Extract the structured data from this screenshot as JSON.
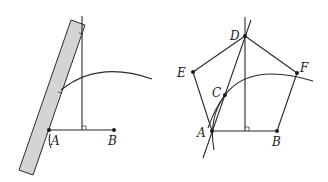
{
  "figure_left": {
    "labels": {
      "A": "A",
      "B": "B"
    },
    "colors": {
      "ruler_fill": "#d4d4d4",
      "stroke": "#2a2a2a"
    },
    "description": "Constructing a perpendicular at the midpoint of AB with a ruler and an arc"
  },
  "figure_right": {
    "labels": {
      "A": "A",
      "B": "B",
      "C": "C",
      "D": "D",
      "E": "E",
      "F": "F"
    },
    "description": "Regular pentagon ABFDE constructed from segment AB using perpendicular bisector and arcs"
  }
}
